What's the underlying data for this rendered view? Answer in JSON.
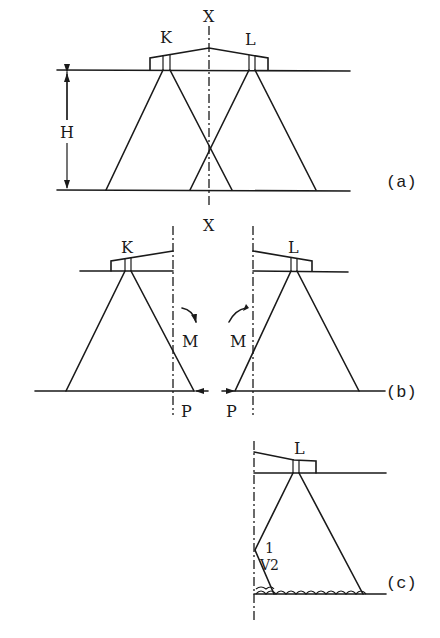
{
  "figure": {
    "panels": [
      {
        "id": "a",
        "tag": "(a)",
        "axis_label": "X",
        "left_label": "K",
        "right_label": "L",
        "height_label": "H"
      },
      {
        "id": "b",
        "tag": "(b)",
        "axis_label": "X",
        "left_label": "K",
        "right_label": "L",
        "moment_left": "M",
        "moment_right": "M",
        "force_left": "P",
        "force_right": "P"
      },
      {
        "id": "c",
        "tag": "(c)",
        "label": "L",
        "slope_rise": "1",
        "slope_run": "√2",
        "slope_display": "V2"
      }
    ],
    "colors": {
      "ink": "#1a1a1a",
      "background": "#ffffff"
    }
  }
}
